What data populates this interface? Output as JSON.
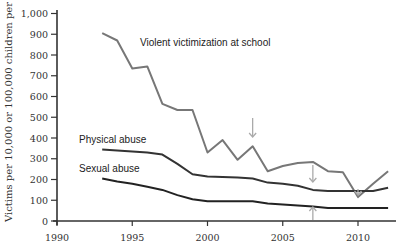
{
  "chart_data": {
    "type": "line",
    "title": "",
    "xlabel": "",
    "ylabel": "Victims per 10,000 or 100,000 children per year",
    "xlim": [
      1990,
      2012.5
    ],
    "ylim": [
      0,
      1000
    ],
    "x_ticks": [
      1990,
      1995,
      2000,
      2005,
      2010
    ],
    "x_tick_labels": [
      "1990",
      "1995",
      "2000",
      "2005",
      "2010"
    ],
    "y_ticks": [
      0,
      100,
      200,
      300,
      400,
      500,
      600,
      700,
      800,
      900,
      1000
    ],
    "y_tick_labels": [
      "0",
      "100",
      "200",
      "300",
      "400",
      "500",
      "600",
      "700",
      "800",
      "900",
      "1,000"
    ],
    "grid": false,
    "legend": "inline labels",
    "x": [
      1993,
      1994,
      1995,
      1996,
      1997,
      1998,
      1999,
      2000,
      2001,
      2002,
      2003,
      2004,
      2005,
      2006,
      2007,
      2008,
      2009,
      2010,
      2011,
      2012
    ],
    "series": [
      {
        "name": "Violent victimization at school",
        "color": "#777777",
        "values": [
          905,
          870,
          735,
          745,
          565,
          535,
          535,
          330,
          390,
          295,
          360,
          240,
          265,
          280,
          285,
          240,
          235,
          115,
          180,
          240
        ]
      },
      {
        "name": "Physical abuse",
        "color": "#333333",
        "values": [
          345,
          340,
          335,
          330,
          320,
          275,
          225,
          215,
          212,
          210,
          205,
          185,
          180,
          170,
          150,
          145,
          145,
          145,
          145,
          160
        ]
      },
      {
        "name": "Sexual abuse",
        "color": "#222222",
        "values": [
          205,
          190,
          180,
          165,
          150,
          125,
          105,
          95,
          95,
          95,
          95,
          85,
          80,
          75,
          70,
          62,
          62,
          62,
          62,
          62
        ]
      }
    ],
    "annotations": [
      {
        "type": "arrow-down",
        "x": 2003,
        "target": "Violent victimization at school"
      },
      {
        "type": "arrow-down",
        "x": 2007,
        "target": "Physical abuse"
      },
      {
        "type": "arrow-up",
        "x": 2007,
        "target": "Sexual abuse"
      },
      {
        "type": "arrow-down",
        "x": 2010,
        "target": "Violent victimization at school"
      }
    ]
  },
  "labels": {
    "violent": "Violent victimization at school",
    "physical": "Physical abuse",
    "sexual": "Sexual abuse",
    "ylabel": "Victims per 10,000 or 100,000 children per year"
  }
}
